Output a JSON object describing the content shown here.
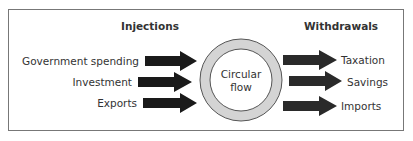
{
  "diagram": {
    "left_heading": "Injections",
    "right_heading": "Withdrawals",
    "center": {
      "line1": "Circular",
      "line2": "flow",
      "ring_color": "#d4d4d4",
      "outline_color": "#555555"
    },
    "injections": [
      {
        "label": "Government spending"
      },
      {
        "label": "Investment"
      },
      {
        "label": "Exports"
      }
    ],
    "withdrawals": [
      {
        "label": "Taxation"
      },
      {
        "label": "Savings"
      },
      {
        "label": "Imports"
      }
    ],
    "arrow_color": "#1a1a1a",
    "border_color": "#777777"
  }
}
